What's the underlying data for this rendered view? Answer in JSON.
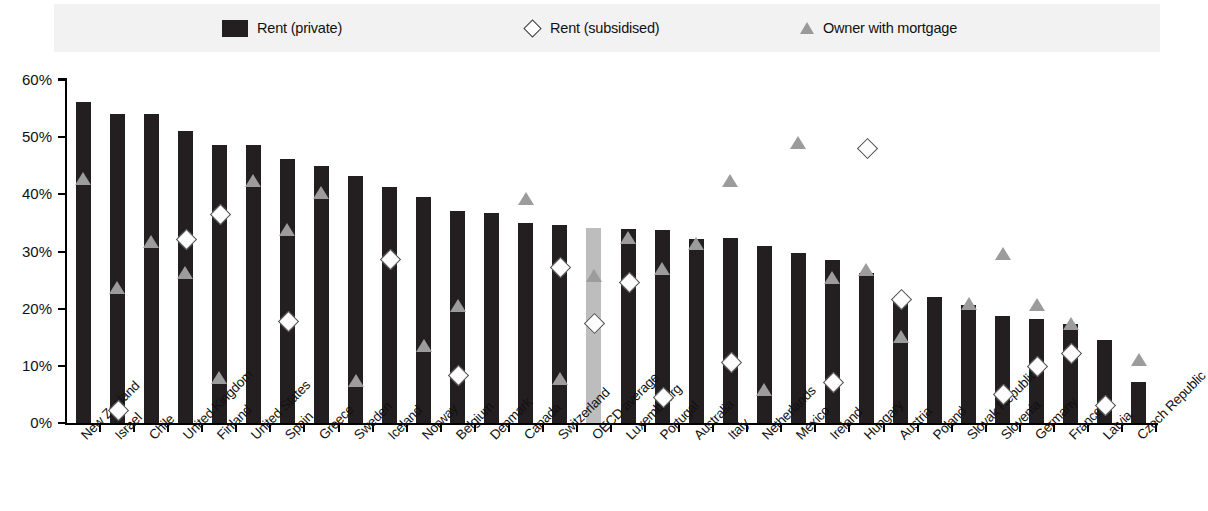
{
  "legend": {
    "items": [
      {
        "label": "Rent (private)",
        "marker": "filled-square",
        "color": "#231f20"
      },
      {
        "label": "Rent (subsidised)",
        "marker": "open-diamond",
        "color": "#ffffff"
      },
      {
        "label": "Owner with mortgage",
        "marker": "grey-triangle",
        "color": "#9c9c9c"
      }
    ]
  },
  "axis": {
    "y_ticks": [
      "0%",
      "10%",
      "20%",
      "30%",
      "40%",
      "50%",
      "60%"
    ]
  },
  "chart_data": {
    "type": "bar",
    "title": "",
    "subtitle": "",
    "xlabel": "",
    "ylabel": "",
    "ylim": [
      0,
      60
    ],
    "ytick_values": [
      0,
      10,
      20,
      30,
      40,
      50,
      60
    ],
    "ytick_labels": [
      "0%",
      "10%",
      "20%",
      "30%",
      "40%",
      "50%",
      "60%"
    ],
    "grid": false,
    "legend_position": "top",
    "highlight_category": "OECD average",
    "highlight_color": "#bdbdbd",
    "bar_color": "#231f20",
    "categories": [
      "New Zealand",
      "Israel",
      "Chile",
      "United Kingdom",
      "Finland",
      "United States",
      "Spain",
      "Greece",
      "Sweden",
      "Iceland",
      "Norway",
      "Belgium",
      "Denmark",
      "Canada",
      "Switzerland",
      "OECD average",
      "Luxembourg",
      "Portugal",
      "Australia",
      "Italy",
      "Netherlands",
      "Mexico",
      "Ireland",
      "Hungary",
      "Austria",
      "Poland",
      "Slovak Republic",
      "Slovenia",
      "Germany",
      "France",
      "Latvia",
      "Czech Republic"
    ],
    "series": [
      {
        "name": "Rent (private)",
        "marker": "bar",
        "values": [
          56.2,
          54.1,
          54.0,
          51.0,
          48.6,
          48.7,
          46.2,
          44.9,
          43.2,
          41.3,
          39.5,
          37.0,
          36.8,
          35.0,
          34.6,
          34.1,
          33.9,
          33.7,
          32.2,
          32.4,
          31.0,
          29.7,
          28.6,
          26.2,
          22.1,
          22.0,
          20.6,
          18.8,
          18.2,
          17.4,
          14.5,
          7.1
        ]
      },
      {
        "name": "Rent (subsidised)",
        "marker": "open-diamond",
        "values": [
          null,
          2.3,
          null,
          32.2,
          36.6,
          null,
          17.9,
          null,
          null,
          28.7,
          null,
          8.5,
          null,
          null,
          27.4,
          17.6,
          24.8,
          4.6,
          null,
          10.8,
          null,
          null,
          7.2,
          48.2,
          21.8,
          null,
          null,
          5.2,
          10.0,
          12.3,
          3.3,
          null
        ]
      },
      {
        "name": "Owner with mortgage",
        "marker": "grey-triangle",
        "values": [
          42.7,
          23.7,
          31.7,
          26.3,
          7.8,
          42.3,
          33.8,
          40.2,
          7.3,
          null,
          13.5,
          20.5,
          null,
          39.2,
          7.7,
          25.7,
          32.4,
          27.0,
          31.3,
          42.3,
          5.8,
          49.0,
          25.4,
          26.8,
          15.0,
          null,
          20.8,
          29.5,
          20.6,
          17.4,
          null,
          11.1
        ]
      }
    ]
  }
}
